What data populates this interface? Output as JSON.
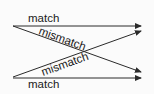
{
  "diagram": {
    "colors": {
      "line": "#2a2a2a",
      "text": "#1a1a1a",
      "background": "#fbfbfb"
    },
    "edges": [
      {
        "id": "top-match",
        "label": "match",
        "from": "top-left",
        "to": "top-right"
      },
      {
        "id": "top-to-bottom-mismatch",
        "label": "mismatch",
        "from": "top-left",
        "to": "bottom-right"
      },
      {
        "id": "bottom-to-top-mismatch",
        "label": "mismatch",
        "from": "bottom-left",
        "to": "top-right"
      },
      {
        "id": "bottom-match",
        "label": "match",
        "from": "bottom-left",
        "to": "bottom-right"
      }
    ]
  }
}
